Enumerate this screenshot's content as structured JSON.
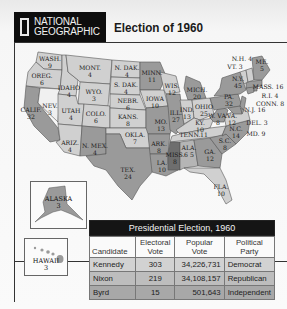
{
  "header": {
    "logo_line1": "NATIONAL",
    "logo_line2": "GEOGRAPHIC",
    "title": "Election of 1960"
  },
  "colors": {
    "kennedy_states": "#9a9a9a",
    "nixon_states": "#d0d0d0",
    "byrd_states": "#6e6e6e",
    "split_states": "#b5b5b5",
    "logo_bg": "#0d0d0d",
    "table_header_bg": "#151515"
  },
  "map": {
    "states": [
      {
        "name": "WASH.",
        "ev": "9"
      },
      {
        "name": "OREG.",
        "ev": "6"
      },
      {
        "name": "CALIF.",
        "ev": "32"
      },
      {
        "name": "NEV.",
        "ev": "3"
      },
      {
        "name": "IDAHO",
        "ev": "4"
      },
      {
        "name": "MONT.",
        "ev": "4"
      },
      {
        "name": "WYO.",
        "ev": "3"
      },
      {
        "name": "UTAH",
        "ev": "4"
      },
      {
        "name": "COLO.",
        "ev": "6"
      },
      {
        "name": "ARIZ.",
        "ev": "4"
      },
      {
        "name": "N. MEX.",
        "ev": "4"
      },
      {
        "name": "N. DAK.",
        "ev": "4"
      },
      {
        "name": "S. DAK.",
        "ev": "4"
      },
      {
        "name": "NEBR.",
        "ev": "6"
      },
      {
        "name": "KANS.",
        "ev": "8"
      },
      {
        "name": "OKLA.",
        "ev": "7"
      },
      {
        "name": "TEX.",
        "ev": "24"
      },
      {
        "name": "MINN.",
        "ev": "11"
      },
      {
        "name": "IOWA",
        "ev": "10"
      },
      {
        "name": "MO.",
        "ev": "13"
      },
      {
        "name": "ARK.",
        "ev": "8"
      },
      {
        "name": "LA.",
        "ev": "10"
      },
      {
        "name": "WIS.",
        "ev": "12"
      },
      {
        "name": "ILL.",
        "ev": "27"
      },
      {
        "name": "MICH.",
        "ev": "20"
      },
      {
        "name": "IND.",
        "ev": "13"
      },
      {
        "name": "OHIO",
        "ev": "25"
      },
      {
        "name": "KY.",
        "ev": "10"
      },
      {
        "name": "TENN.",
        "ev": "11"
      },
      {
        "name": "MISS.",
        "ev": "8"
      },
      {
        "name": "ALA.",
        "ev": "6 5"
      },
      {
        "name": "GA.",
        "ev": "12"
      },
      {
        "name": "FLA.",
        "ev": "10"
      },
      {
        "name": "S.C.",
        "ev": "8"
      },
      {
        "name": "N.C.",
        "ev": "14"
      },
      {
        "name": "VA.",
        "ev": "12"
      },
      {
        "name": "W. VA.",
        "ev": "8"
      },
      {
        "name": "PA.",
        "ev": "32"
      },
      {
        "name": "N.Y.",
        "ev": "45"
      },
      {
        "name": "N.J.",
        "ev": "16"
      },
      {
        "name": "DEL.",
        "ev": "3"
      },
      {
        "name": "MD.",
        "ev": "9"
      },
      {
        "name": "CONN.",
        "ev": "8"
      },
      {
        "name": "R.I.",
        "ev": "4"
      },
      {
        "name": "MASS.",
        "ev": "16"
      },
      {
        "name": "VT.",
        "ev": "3"
      },
      {
        "name": "N.H.",
        "ev": "4"
      },
      {
        "name": "ME.",
        "ev": "5"
      }
    ],
    "alaska": {
      "name": "ALASKA",
      "ev": "3"
    },
    "hawaii": {
      "name": "HAWAII",
      "ev": "3"
    }
  },
  "table": {
    "title": "Presidential Election, 1960",
    "columns": [
      "Candidate",
      "Electoral Vote",
      "Popular Vote",
      "Political Party"
    ],
    "columns_split": [
      [
        "Candidate",
        ""
      ],
      [
        "Electoral",
        "Vote"
      ],
      [
        "Popular",
        "Vote"
      ],
      [
        "Political",
        "Party"
      ]
    ],
    "rows": [
      {
        "candidate": "Kennedy",
        "electoral": "303",
        "popular": "34,226,731",
        "party": "Democrat"
      },
      {
        "candidate": "Nixon",
        "electoral": "219",
        "popular": "34,108,157",
        "party": "Republican"
      },
      {
        "candidate": "Byrd",
        "electoral": "15",
        "popular": "501,643",
        "party": "Independent"
      }
    ]
  }
}
